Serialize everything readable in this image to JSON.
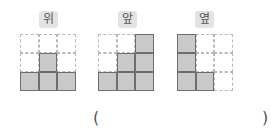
{
  "views": [
    {
      "id": "top",
      "label": "위",
      "grid": [
        [
          0,
          0,
          0
        ],
        [
          0,
          1,
          0
        ],
        [
          1,
          1,
          1
        ]
      ]
    },
    {
      "id": "front",
      "label": "앞",
      "grid": [
        [
          0,
          0,
          1
        ],
        [
          0,
          1,
          1
        ],
        [
          1,
          1,
          1
        ]
      ]
    },
    {
      "id": "side",
      "label": "옆",
      "grid": [
        [
          1,
          0,
          0
        ],
        [
          1,
          0,
          0
        ],
        [
          1,
          1,
          0
        ]
      ]
    }
  ],
  "answer": {
    "open_paren": "(",
    "close_paren": ")",
    "value": ""
  },
  "colors": {
    "filled": "#c9c9c9",
    "filled_border": "#6e6e6e",
    "empty_border": "#b8b8b8",
    "label_bg": "#e3e3e3",
    "label_text": "#555555"
  }
}
